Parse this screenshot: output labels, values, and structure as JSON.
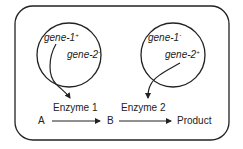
{
  "diagram": {
    "type": "complementation-pathway",
    "left_circle": {
      "gene_a": {
        "name": "gene-1",
        "allele": "+"
      },
      "gene_b": {
        "name": "gene-2",
        "allele": "-"
      }
    },
    "right_circle": {
      "gene_a": {
        "name": "gene-1",
        "allele": "-"
      },
      "gene_b": {
        "name": "gene-2",
        "allele": "+"
      }
    },
    "pathway": {
      "enzyme1": "Enzyme 1",
      "enzyme2": "Enzyme 2",
      "substrate": "A",
      "intermediate": "B",
      "product": "Product"
    },
    "colors": {
      "stroke": "#222222",
      "background": "#ffffff"
    }
  }
}
